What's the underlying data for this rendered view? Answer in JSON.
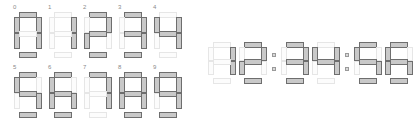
{
  "page": {
    "background_color": "#ffffff"
  },
  "colors": {
    "segment_on_fill": "#c9c9c9",
    "segment_on_stroke": "#6e6e6e",
    "segment_off_fill": "#fcfcfc",
    "segment_off_stroke": "#e6e6e6",
    "label_text": "#8a8a8a",
    "colon_fill": "#d9d9d9",
    "colon_stroke": "#9a9a9a"
  },
  "segment_map": {
    "order": [
      "a",
      "b",
      "c",
      "d",
      "e",
      "f",
      "g"
    ],
    "0": [
      "a",
      "b",
      "c",
      "d",
      "e",
      "f"
    ],
    "1": [
      "b",
      "c"
    ],
    "2": [
      "a",
      "b",
      "g",
      "e",
      "d"
    ],
    "3": [
      "a",
      "b",
      "g",
      "c",
      "d"
    ],
    "4": [
      "f",
      "g",
      "b",
      "c"
    ],
    "5": [
      "a",
      "f",
      "g",
      "c",
      "d"
    ],
    "6": [
      "a",
      "f",
      "g",
      "e",
      "c",
      "d"
    ],
    "7": [
      "a",
      "b",
      "c"
    ],
    "8": [
      "a",
      "b",
      "c",
      "d",
      "e",
      "f",
      "g"
    ],
    "9": [
      "a",
      "b",
      "c",
      "d",
      "f",
      "g"
    ]
  },
  "digit_grid": {
    "name": "digit-reference-grid",
    "rows": [
      {
        "cells": [
          {
            "label": "0",
            "value": "0"
          },
          {
            "label": "1",
            "value": "1"
          },
          {
            "label": "2",
            "value": "2"
          },
          {
            "label": "3",
            "value": "3"
          },
          {
            "label": "4",
            "value": "4"
          }
        ]
      },
      {
        "cells": [
          {
            "label": "5",
            "value": "5"
          },
          {
            "label": "6",
            "value": "6"
          },
          {
            "label": "7",
            "value": "7"
          },
          {
            "label": "8",
            "value": "8"
          },
          {
            "label": "9",
            "value": "9"
          }
        ]
      }
    ]
  },
  "clock": {
    "name": "seven-segment-clock",
    "time_text": "12:34:56",
    "hours": [
      "1",
      "2"
    ],
    "minutes": [
      "3",
      "4"
    ],
    "seconds": [
      "5",
      "6"
    ],
    "separator": ":",
    "groups": [
      {
        "type": "digits",
        "values": [
          "1",
          "2"
        ]
      },
      {
        "type": "colon",
        "value": ":"
      },
      {
        "type": "digits",
        "values": [
          "3",
          "4"
        ]
      },
      {
        "type": "colon",
        "value": ":"
      },
      {
        "type": "digits",
        "values": [
          "5",
          "6"
        ]
      }
    ]
  }
}
